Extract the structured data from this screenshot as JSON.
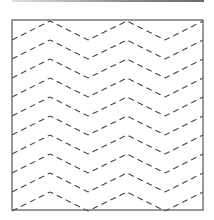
{
  "diagram": {
    "type": "zigzag-dashed-pattern",
    "frame": {
      "x": 12,
      "y": 20,
      "width": 191,
      "height": 190,
      "stroke": "#555555"
    },
    "top_rule": {
      "color": "#8a8a8a"
    },
    "line_style": {
      "stroke": "#444444",
      "dash": "6 4",
      "width": 1.1
    },
    "zigzag": {
      "line_count": 10,
      "spacing": 19,
      "first_peak_y": 21,
      "amplitude": 19,
      "vertices_x": [
        12,
        50,
        88,
        127,
        165,
        203
      ],
      "vertex_kind": [
        "valley",
        "peak",
        "valley",
        "peak",
        "valley",
        "peak"
      ]
    }
  }
}
